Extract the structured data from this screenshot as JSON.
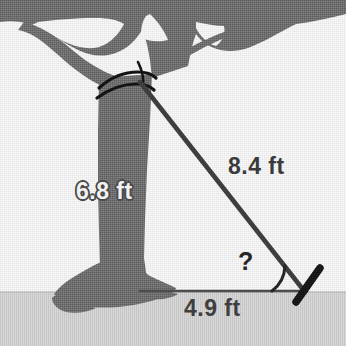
{
  "figure": {
    "background_color": "#fafafa",
    "ground_color": "#d5d5d5",
    "tree_color": "#6e6e6e",
    "wire_color": "#3a3a3a",
    "stake_color": "#111111",
    "rope_color": "#0d0d0d"
  },
  "labels": {
    "height": "6.8 ft",
    "hypotenuse": "8.4 ft",
    "base": "4.9 ft",
    "angle": "?"
  },
  "geometry": {
    "tree_top_attachment_x": 140,
    "tree_top_attachment_y": 82,
    "ground_line_y": 292,
    "stake_x": 305,
    "trunk_base_x": 140
  },
  "icons": {
    "tree": "tree-icon",
    "ground": "ground-icon",
    "wire": "guy-wire-icon",
    "stake": "ground-stake-icon",
    "rope": "rope-wrap-icon",
    "angle_arc": "angle-arc-icon"
  }
}
